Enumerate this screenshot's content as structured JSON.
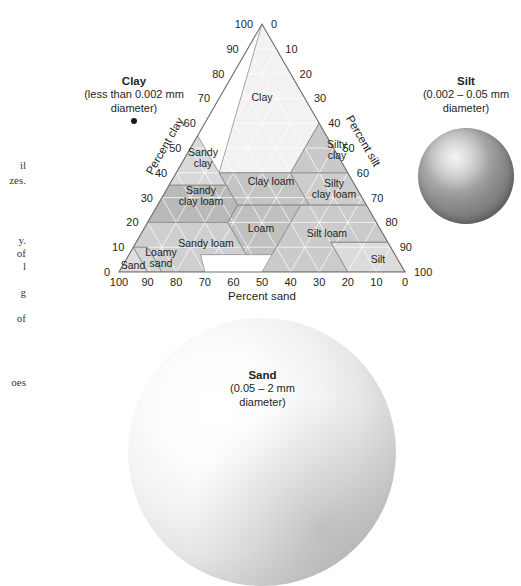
{
  "figure": {
    "type": "soil-texture-triangle",
    "axes": {
      "bottom": {
        "title": "Percent sand",
        "ticks": [
          100,
          90,
          80,
          70,
          60,
          50,
          40,
          30,
          20,
          10,
          0
        ]
      },
      "left": {
        "title": "Percent clay",
        "ticks": [
          0,
          10,
          20,
          30,
          40,
          50,
          60,
          70,
          80,
          90,
          100
        ]
      },
      "right": {
        "title": "Percent silt",
        "ticks": [
          0,
          10,
          20,
          30,
          40,
          50,
          60,
          70,
          80,
          90,
          100
        ]
      }
    },
    "classes": [
      {
        "name": "Clay",
        "label_lines": [
          "Clay"
        ],
        "cx": 262,
        "cy": 97,
        "shade": "#f2f2f2"
      },
      {
        "name": "Silty clay",
        "label_lines": [
          "Silty",
          "clay"
        ],
        "cx": 337,
        "cy": 150,
        "shade": "#c9c9c9"
      },
      {
        "name": "Sandy clay",
        "label_lines": [
          "Sandy",
          "clay"
        ],
        "cx": 203,
        "cy": 158,
        "shade": "#d9d9d9"
      },
      {
        "name": "Clay loam",
        "label_lines": [
          "Clay loam"
        ],
        "cx": 271,
        "cy": 181,
        "shade": "#c4c4c4"
      },
      {
        "name": "Silty clay loam",
        "label_lines": [
          "Silty",
          "clay loam"
        ],
        "cx": 334,
        "cy": 189,
        "shade": "#cdcdcd"
      },
      {
        "name": "Sandy clay loam",
        "label_lines": [
          "Sandy",
          "clay loam"
        ],
        "cx": 201,
        "cy": 196,
        "shade": "#b9b9b9"
      },
      {
        "name": "Loam",
        "label_lines": [
          "Loam"
        ],
        "cx": 261,
        "cy": 228,
        "shade": "#c0c0c0"
      },
      {
        "name": "Silt loam",
        "label_lines": [
          "Silt loam"
        ],
        "cx": 327,
        "cy": 233,
        "shade": "#cbcbcb"
      },
      {
        "name": "Sandy loam",
        "label_lines": [
          "Sandy loam"
        ],
        "cx": 206,
        "cy": 243,
        "shade": "#cfcfcf"
      },
      {
        "name": "Loamy sand",
        "label_lines": [
          "Loamy",
          "sand"
        ],
        "cx": 161,
        "cy": 258,
        "shade": "#d6d6d6"
      },
      {
        "name": "Sand",
        "label_lines": [
          "Sand"
        ],
        "cx": 133,
        "cy": 265,
        "shade": "#dedede"
      },
      {
        "name": "Silt",
        "label_lines": [
          "Silt"
        ],
        "cx": 378,
        "cy": 259,
        "shade": "#dcdcdc"
      }
    ]
  },
  "callouts": {
    "clay": {
      "title": "Clay",
      "size": "(less than 0.002 mm",
      "size2": "diameter)",
      "icon": "clay-particle-dot"
    },
    "silt": {
      "title": "Silt",
      "size": "(0.002 – 0.05 mm",
      "size2": "diameter)",
      "icon": "silt-particle-sphere"
    },
    "sand": {
      "title": "Sand",
      "size": "(0.05 – 2 mm",
      "size2": "diameter)",
      "icon": "sand-particle-sphere"
    }
  },
  "column_fragments": [
    {
      "text": "il",
      "top": 159
    },
    {
      "text": "zes.",
      "top": 174
    },
    {
      "text": "y.",
      "top": 234
    },
    {
      "text": "of",
      "top": 247
    },
    {
      "text": "l",
      "top": 260
    },
    {
      "text": "g",
      "top": 286
    },
    {
      "text": "of",
      "top": 312
    },
    {
      "text": "oes",
      "top": 376
    }
  ],
  "chart_data": {
    "type": "ternary",
    "apex": {
      "clay": 100,
      "sand": 0,
      "silt": 0
    },
    "axis_titles": [
      "Percent sand",
      "Percent clay",
      "Percent silt"
    ],
    "tick_step": 10,
    "axis_range": [
      0,
      100
    ],
    "grid": true,
    "legend": "none",
    "classes": [
      {
        "name": "Clay",
        "centroid": {
          "clay": 62,
          "sand": 22,
          "silt": 16
        }
      },
      {
        "name": "Silty clay",
        "centroid": {
          "clay": 47,
          "sand": 7,
          "silt": 46
        }
      },
      {
        "name": "Sandy clay",
        "centroid": {
          "clay": 42,
          "sand": 53,
          "silt": 5
        }
      },
      {
        "name": "Clay loam",
        "centroid": {
          "clay": 33,
          "sand": 33,
          "silt": 34
        }
      },
      {
        "name": "Silty clay loam",
        "centroid": {
          "clay": 33,
          "sand": 10,
          "silt": 57
        }
      },
      {
        "name": "Sandy clay loam",
        "centroid": {
          "clay": 27,
          "sand": 60,
          "silt": 13
        }
      },
      {
        "name": "Loam",
        "centroid": {
          "clay": 17,
          "sand": 41,
          "silt": 42
        }
      },
      {
        "name": "Silt loam",
        "centroid": {
          "clay": 14,
          "sand": 21,
          "silt": 65
        }
      },
      {
        "name": "Sandy loam",
        "centroid": {
          "clay": 10,
          "sand": 65,
          "silt": 25
        }
      },
      {
        "name": "Loamy sand",
        "centroid": {
          "clay": 5,
          "sand": 82,
          "silt": 13
        }
      },
      {
        "name": "Sand",
        "centroid": {
          "clay": 3,
          "sand": 92,
          "silt": 5
        }
      },
      {
        "name": "Silt",
        "centroid": {
          "clay": 5,
          "sand": 8,
          "silt": 87
        }
      }
    ]
  }
}
